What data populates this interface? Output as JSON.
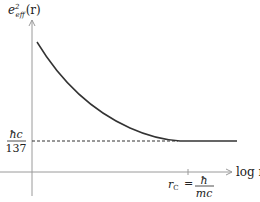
{
  "diagram": {
    "type": "line",
    "y_axis_label": {
      "base": "e",
      "sup": "2",
      "sub": "eff",
      "arg": "(r)"
    },
    "x_axis_label": "log r",
    "asymptote_label": {
      "numerator": "ħc",
      "denominator": "137"
    },
    "tick_label": {
      "lhs": "r",
      "lhs_sub": "C",
      "equals": "=",
      "numerator": "ħ",
      "denominator": "mc"
    },
    "curve_description": "effective charge squared decreasing with log r, flattening to hc/137 beyond r_C",
    "colors": {
      "axis": "#9a9a9a",
      "curve": "#333333",
      "dashed": "#333333",
      "text": "#222222"
    }
  }
}
